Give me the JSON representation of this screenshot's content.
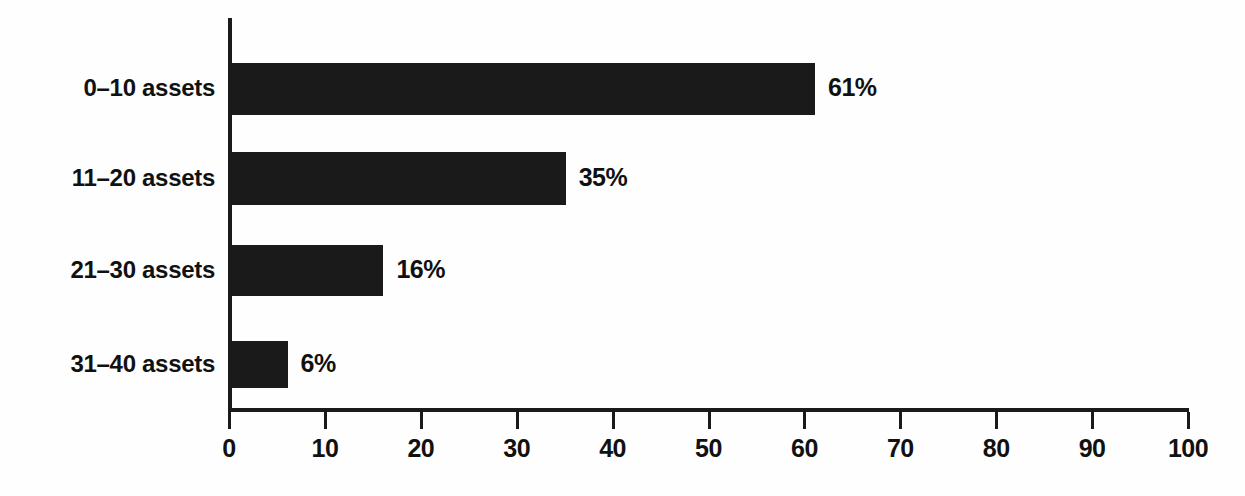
{
  "chart_data": {
    "type": "bar",
    "orientation": "horizontal",
    "title": "",
    "subtitle": "",
    "xlabel": "",
    "ylabel": "",
    "categories": [
      "0–10 assets",
      "11–20 assets",
      "21–30 assets",
      "31–40 assets"
    ],
    "values": [
      61,
      35,
      16,
      6
    ],
    "value_labels": [
      "61%",
      "35%",
      "16%",
      "6%"
    ],
    "xlim": [
      0,
      100
    ],
    "xticks": [
      0,
      10,
      20,
      30,
      40,
      50,
      60,
      70,
      80,
      90,
      100
    ],
    "xtick_labels": [
      "0",
      "10",
      "20",
      "30",
      "40",
      "50",
      "60",
      "70",
      "80",
      "90",
      "100"
    ],
    "grid": false,
    "legend": null,
    "bar_color": "#1a1a1a",
    "axis_color": "#1a1a1a",
    "background_color": "#fefefe",
    "text_color": "#111111"
  }
}
